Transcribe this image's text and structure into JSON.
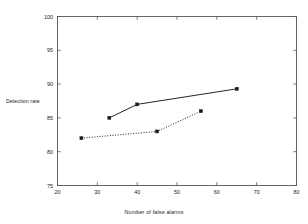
{
  "chart_data": {
    "type": "line",
    "title": "",
    "xlabel": "Number of false alarms",
    "ylabel": "Detection rate",
    "xlim": [
      20,
      80
    ],
    "ylim": [
      75,
      100
    ],
    "xticks": [
      20,
      30,
      40,
      50,
      60,
      70,
      80
    ],
    "yticks": [
      75,
      80,
      85,
      90,
      95,
      100
    ],
    "grid": false,
    "legend": "none",
    "series": [
      {
        "name": "solid-series",
        "style": "solid",
        "marker": "square",
        "color": "#1a1a1a",
        "points": [
          {
            "x": 33,
            "y": 85.0
          },
          {
            "x": 40,
            "y": 87.0
          },
          {
            "x": 65,
            "y": 89.3
          }
        ]
      },
      {
        "name": "dotted-series",
        "style": "dotted",
        "marker": "square",
        "color": "#1a1a1a",
        "points": [
          {
            "x": 26,
            "y": 82.0
          },
          {
            "x": 45,
            "y": 83.0
          },
          {
            "x": 56,
            "y": 86.0
          }
        ]
      }
    ]
  },
  "axis": {
    "ylabel": "Detection rate",
    "xlabel": "Number of false alarms",
    "xtick_labels": [
      "20",
      "30",
      "40",
      "50",
      "60",
      "70",
      "80"
    ],
    "ytick_labels": [
      "75",
      "80",
      "85",
      "90",
      "95",
      "100"
    ]
  }
}
